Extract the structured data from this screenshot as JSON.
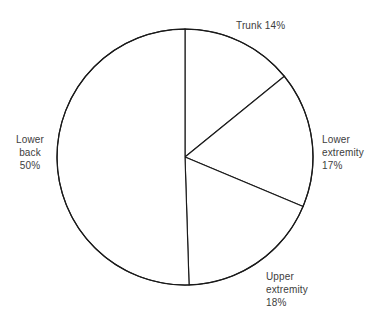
{
  "chart_data": {
    "type": "pie",
    "title": "",
    "subtitle": "",
    "xlabel": "",
    "ylabel": "",
    "legend_position": "none",
    "grid": false,
    "start_angle_deg_from_12oclock": 0,
    "direction": "clockwise",
    "units": "percent",
    "categories": [
      "Trunk",
      "Lower extremity",
      "Upper extremity",
      "Lower back"
    ],
    "values": [
      14,
      17,
      18,
      50
    ],
    "slices": [
      {
        "name": "Trunk",
        "value": 14,
        "value_text": "14%",
        "label_text": "Trunk 14%",
        "label_lines": [
          "Trunk 14%"
        ],
        "sweep_deg": 50.4,
        "start_deg": 0,
        "end_deg": 50.4,
        "fill": "#ffffff",
        "stroke": "#1a1a1a"
      },
      {
        "name": "Lower extremity",
        "value": 17,
        "value_text": "17%",
        "label_text": "Lower extremity 17%",
        "label_lines": [
          "Lower",
          "extremity",
          "17%"
        ],
        "sweep_deg": 61.2,
        "start_deg": 50.4,
        "end_deg": 111.6,
        "fill": "#ffffff",
        "stroke": "#1a1a1a"
      },
      {
        "name": "Upper extremity",
        "value": 18,
        "value_text": "18%",
        "label_text": "Upper extremity 18%",
        "label_lines": [
          "Upper",
          "extremity",
          "18%"
        ],
        "sweep_deg": 64.8,
        "start_deg": 111.6,
        "end_deg": 176.4,
        "fill": "#ffffff",
        "stroke": "#1a1a1a"
      },
      {
        "name": "Lower back",
        "value": 50,
        "value_text": "50%",
        "label_text": "Lower back 50%",
        "label_lines": [
          "Lower",
          "back",
          "50%"
        ],
        "sweep_deg": 180,
        "start_deg": 176.4,
        "end_deg": 356.4,
        "fill": "#ffffff",
        "stroke": "#1a1a1a"
      }
    ],
    "geometry": {
      "center_x": 185,
      "center_y": 157,
      "radius": 128
    },
    "colors": {
      "background": "#ffffff",
      "outline": "#1a1a1a",
      "label_text": "#3d3d3d"
    }
  },
  "labels": {
    "trunk": "Trunk 14%",
    "lower_extremity": "Lower\nextremity\n17%",
    "upper_extremity": "Upper\nextremity\n18%",
    "lower_back": "Lower\nback\n50%"
  }
}
